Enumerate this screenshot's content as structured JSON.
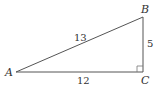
{
  "diagram": {
    "type": "right-triangle",
    "vertices": {
      "A": {
        "label": "A",
        "x": 16,
        "y": 72
      },
      "B": {
        "label": "B",
        "x": 143,
        "y": 17
      },
      "C": {
        "label": "C",
        "x": 143,
        "y": 72
      }
    },
    "sides": {
      "AB": {
        "label": "13"
      },
      "BC": {
        "label": "5"
      },
      "AC": {
        "label": "12"
      }
    },
    "right_angle_at": "C",
    "colors": {
      "stroke": "#555555",
      "text": "#333333"
    }
  }
}
